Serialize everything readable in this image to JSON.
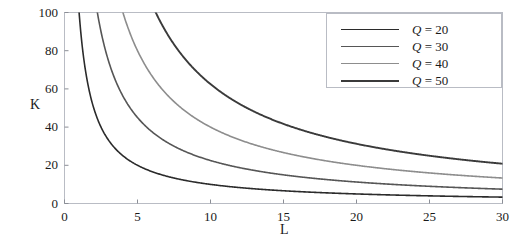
{
  "chart_data": {
    "type": "line",
    "title": "",
    "subtitle": "",
    "xlabel": "L",
    "ylabel": "K",
    "xlim": [
      0,
      30
    ],
    "ylim": [
      0,
      100
    ],
    "xticks": [
      0,
      5,
      10,
      15,
      20,
      25,
      30
    ],
    "yticks": [
      0,
      20,
      40,
      60,
      80,
      100
    ],
    "xtick_labels": [
      "0",
      "5",
      "10",
      "15",
      "20",
      "25",
      "30"
    ],
    "ytick_labels": [
      "0",
      "20",
      "40",
      "60",
      "80",
      "100"
    ],
    "grid": false,
    "frame": true,
    "legend_position": "top-right",
    "annotations": [],
    "relation": "K = Q^2 / (4 L)",
    "series": [
      {
        "name": "Q = 20",
        "q": 20,
        "color": "#2b2b2b",
        "width": 1.6,
        "x": [
          1,
          1.5,
          2,
          2.5,
          3,
          4,
          5,
          6,
          7,
          8,
          9,
          10,
          12,
          14,
          16,
          18,
          20,
          22,
          24,
          26,
          28,
          30
        ],
        "y": [
          100,
          66.7,
          50,
          40,
          33.3,
          25,
          20,
          16.7,
          14.3,
          12.5,
          11.1,
          10,
          8.3,
          7.1,
          6.3,
          5.6,
          5,
          4.5,
          4.2,
          3.8,
          3.6,
          3.3
        ]
      },
      {
        "name": "Q = 30",
        "q": 30,
        "color": "#565656",
        "width": 1.6,
        "x": [
          2.25,
          3,
          4,
          5,
          6,
          7,
          8,
          9,
          10,
          12,
          14,
          16,
          18,
          20,
          22,
          24,
          26,
          28,
          30
        ],
        "y": [
          100,
          75,
          56.3,
          45,
          37.5,
          32.1,
          28.1,
          25,
          22.5,
          18.8,
          16.1,
          14.1,
          12.5,
          11.3,
          10.2,
          9.4,
          8.7,
          8,
          7.5
        ]
      },
      {
        "name": "Q = 40",
        "q": 40,
        "color": "#8d8d8d",
        "width": 1.6,
        "x": [
          4,
          5,
          6,
          7,
          8,
          9,
          10,
          12,
          14,
          16,
          18,
          20,
          22,
          24,
          26,
          28,
          30
        ],
        "y": [
          100,
          80,
          66.7,
          57.1,
          50,
          44.4,
          40,
          33.3,
          28.6,
          25,
          22.2,
          20,
          18.2,
          16.7,
          15.4,
          14.3,
          13.3
        ]
      },
      {
        "name": "Q = 50",
        "q": 50,
        "color": "#3a3a3a",
        "width": 1.9,
        "x": [
          6.25,
          7,
          8,
          9,
          10,
          12,
          14,
          16,
          18,
          20,
          22,
          24,
          26,
          28,
          30
        ],
        "y": [
          100,
          89.3,
          78.1,
          69.4,
          62.5,
          52.1,
          44.6,
          39.1,
          34.7,
          31.3,
          28.4,
          26,
          24,
          22.3,
          20.8
        ]
      }
    ],
    "endpoint_values_at_L30": {
      "Q = 20": 3.3,
      "Q = 30": 7.5,
      "Q = 40": 13.3,
      "Q = 50": 20.8
    }
  },
  "legend": {
    "entries": [
      {
        "variable": "Q",
        "equals": "=",
        "value": "20",
        "label": "Q = 20"
      },
      {
        "variable": "Q",
        "equals": "=",
        "value": "30",
        "label": "Q = 30"
      },
      {
        "variable": "Q",
        "equals": "=",
        "value": "40",
        "label": "Q = 40"
      },
      {
        "variable": "Q",
        "equals": "=",
        "value": "50",
        "label": "Q = 50"
      }
    ]
  },
  "axes": {
    "x_axis_label": "L",
    "y_axis_label": "K"
  },
  "colors": {
    "frame": "#b9bcc4",
    "tick": "#8b8e96",
    "text": "#1a1a1a",
    "background": "#ffffff"
  }
}
